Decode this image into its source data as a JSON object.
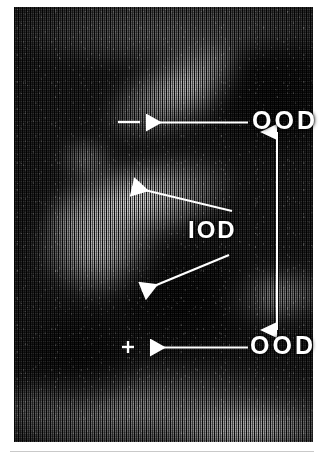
{
  "figure": {
    "kind": "ultrasound-scan-annotated",
    "caption": "",
    "background_color": "#ffffff",
    "scan": {
      "ink_color": "#ffffff",
      "base_color": "#1a1a1a",
      "frame": {
        "left": 14,
        "top": 7,
        "width": 299,
        "height": 435
      }
    }
  },
  "annotations": {
    "labels": [
      {
        "id": "ood-top",
        "text": "OOD",
        "x": 252,
        "y": 108
      },
      {
        "id": "iod",
        "text": "IOD",
        "x": 188,
        "y": 218
      },
      {
        "id": "ood-bottom",
        "text": "OOD",
        "x": 250,
        "y": 333
      }
    ],
    "arrows": [
      {
        "id": "arrow-ood-top",
        "from": [
          248,
          122
        ],
        "to": [
          144,
          122
        ],
        "head": "left"
      },
      {
        "id": "arrow-iod-upper",
        "from": [
          232,
          211
        ],
        "to": [
          130,
          186
        ],
        "head": "upper-left"
      },
      {
        "id": "arrow-iod-lower",
        "from": [
          228,
          255
        ],
        "to": [
          142,
          292
        ],
        "head": "lower-left"
      },
      {
        "id": "arrow-ood-bottom",
        "from": [
          248,
          347
        ],
        "to": [
          148,
          347
        ],
        "head": "left"
      }
    ],
    "measurement": {
      "id": "vertical-double-arrow",
      "x": 277,
      "y_top": 131,
      "y_bottom": 330,
      "heads": "both"
    },
    "calipers": [
      {
        "id": "caliper-top",
        "type": "dash",
        "x": 118,
        "y": 122,
        "width": 22
      },
      {
        "id": "caliper-bottom",
        "type": "cross",
        "x": 128,
        "y": 347,
        "size": 9
      }
    ]
  }
}
